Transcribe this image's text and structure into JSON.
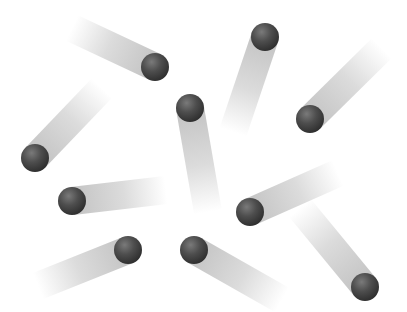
{
  "scene": {
    "description": "Dark grey spheres moving in different directions with fading motion-blur trails on a white background",
    "background": "#ffffff",
    "sphere_color": "#4a4a4a",
    "trail_color": "#b8b8b8",
    "sphere_radius": 14,
    "trail_width": 28,
    "spheres": [
      {
        "cx": 155,
        "cy": 67,
        "tail_x": 72,
        "tail_y": 28
      },
      {
        "cx": 265,
        "cy": 37,
        "tail_x": 233,
        "tail_y": 132
      },
      {
        "cx": 35,
        "cy": 158,
        "tail_x": 102,
        "tail_y": 88
      },
      {
        "cx": 190,
        "cy": 108,
        "tail_x": 208,
        "tail_y": 212
      },
      {
        "cx": 310,
        "cy": 119,
        "tail_x": 382,
        "tail_y": 48
      },
      {
        "cx": 72,
        "cy": 201,
        "tail_x": 166,
        "tail_y": 190
      },
      {
        "cx": 250,
        "cy": 212,
        "tail_x": 338,
        "tail_y": 173
      },
      {
        "cx": 128,
        "cy": 250,
        "tail_x": 38,
        "tail_y": 286
      },
      {
        "cx": 194,
        "cy": 250,
        "tail_x": 282,
        "tail_y": 300
      },
      {
        "cx": 365,
        "cy": 287,
        "tail_x": 300,
        "tail_y": 208
      }
    ]
  }
}
